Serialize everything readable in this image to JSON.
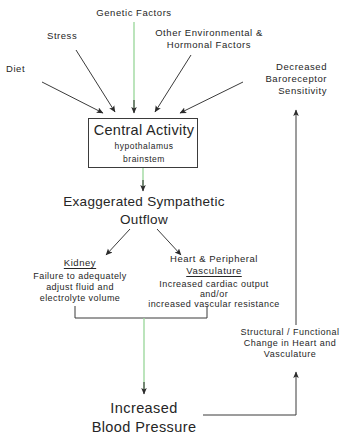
{
  "diagram": {
    "colors": {
      "ink": "#262626",
      "line_dark": "#3b3b3b",
      "line_green": "#9fd9a0",
      "background": "#ffffff"
    }
  },
  "sources": {
    "diet": "Diet",
    "stress": "Stress",
    "genetic": "Genetic Factors",
    "environmental_line1": "Other Environmental &",
    "environmental_line2": "Hormonal Factors",
    "baroreceptor_line1": "Decreased",
    "baroreceptor_line2": "Baroreceptor",
    "baroreceptor_line3": "Sensitivity"
  },
  "central": {
    "title": "Central Activity",
    "sub1": "hypothalamus",
    "sub2": "brainstem"
  },
  "outflow": {
    "line1": "Exaggerated Sympathetic",
    "line2": "Outflow"
  },
  "kidney": {
    "heading": "Kidney",
    "line1": "Failure to adequately",
    "line2": "adjust fluid and",
    "line3": "electrolyte volume"
  },
  "heart": {
    "heading_line1": "Heart & Peripheral",
    "heading_line2": "Vasculature",
    "line1": "Increased cardiac output",
    "line2": "and/or",
    "line3": "increased vascular resistance"
  },
  "feedback": {
    "line1": "Structural / Functional",
    "line2": "Change in Heart and",
    "line3": "Vasculature"
  },
  "outcome": {
    "line1": "Increased",
    "line2": "Blood Pressure"
  }
}
